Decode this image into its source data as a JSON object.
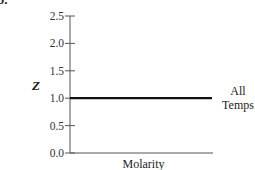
{
  "panel_label": "b.",
  "chart_data": {
    "type": "line",
    "title": "",
    "xlabel": "Molarity",
    "ylabel": "Z",
    "ylim": [
      0.0,
      2.5
    ],
    "yticks": [
      "0.0",
      "0.5",
      "1.0",
      "1.5",
      "2.0",
      "2.5"
    ],
    "xticks": [],
    "grid": false,
    "series": [
      {
        "name": "All Temps",
        "label_lines": [
          "All",
          "Temps"
        ],
        "x": [
          0,
          1
        ],
        "y": [
          1.0,
          1.0
        ],
        "color": "#111111"
      }
    ],
    "legend_position": "inline-right"
  }
}
